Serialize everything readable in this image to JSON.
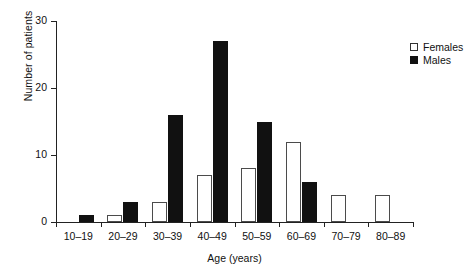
{
  "chart_data": {
    "type": "bar",
    "title": "",
    "xlabel": "Age (years)",
    "ylabel": "Number of patients",
    "categories": [
      "10–19",
      "20–29",
      "30–39",
      "40–49",
      "50–59",
      "60–69",
      "70–79",
      "80–89"
    ],
    "series": [
      {
        "name": "Females",
        "values": [
          0,
          1,
          3,
          7,
          8,
          12,
          4,
          4
        ],
        "color": "#ffffff",
        "edge_color": "#4b4b4b"
      },
      {
        "name": "Males",
        "values": [
          1,
          3,
          16,
          27,
          15,
          6,
          0,
          0
        ],
        "color": "#111111",
        "edge_color": "#111111"
      }
    ],
    "ylim": [
      0,
      30
    ],
    "yticks": [
      0,
      10,
      20,
      30
    ],
    "ytick_labels": [
      "0",
      "10",
      "20",
      "30"
    ],
    "grid": false,
    "legend_position": "top-right",
    "legend_entries": [
      "Females",
      "Males"
    ]
  }
}
